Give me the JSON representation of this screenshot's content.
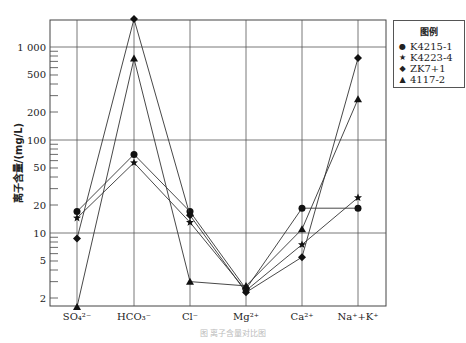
{
  "chart_data": {
    "type": "line",
    "title": "",
    "xlabel": "",
    "ylabel": "离子含量/(mg/L)",
    "yscale": "log",
    "ylim": [
      1.5,
      2500
    ],
    "ytick_labels": [
      "2",
      "5",
      "10",
      "20",
      "50",
      "100",
      "200",
      "500",
      "1 000"
    ],
    "ytick_values": [
      2,
      5,
      10,
      20,
      50,
      100,
      200,
      500,
      1000
    ],
    "categories": [
      "SO₄²⁻",
      "HCO₃⁻",
      "Cl⁻",
      "Mg²⁺",
      "Ca²⁺",
      "Na⁺+K⁺"
    ],
    "grid": true,
    "legend_position": "upper right",
    "series": [
      {
        "name": "K4215-1",
        "marker": "circle",
        "values": [
          17,
          70,
          17,
          2.5,
          18.5,
          18.5
        ]
      },
      {
        "name": "K4223-4",
        "marker": "star",
        "values": [
          14.5,
          57,
          13,
          2.4,
          7.5,
          24
        ]
      },
      {
        "name": "ZK7+1",
        "marker": "diamond",
        "values": [
          8.7,
          2000,
          15.5,
          2.3,
          5.5,
          760
        ]
      },
      {
        "name": "4117-2",
        "marker": "triangle",
        "values": [
          1.6,
          750,
          3,
          2.7,
          11,
          275
        ]
      }
    ]
  },
  "legend": {
    "title": "图例",
    "items": [
      {
        "symbol": "●",
        "label": "K4215-1"
      },
      {
        "symbol": "★",
        "label": "K4223-4"
      },
      {
        "symbol": "◆",
        "label": "ZK7+1"
      },
      {
        "symbol": "▲",
        "label": "4117-2"
      }
    ]
  },
  "caption": "图  离子含量对比图"
}
